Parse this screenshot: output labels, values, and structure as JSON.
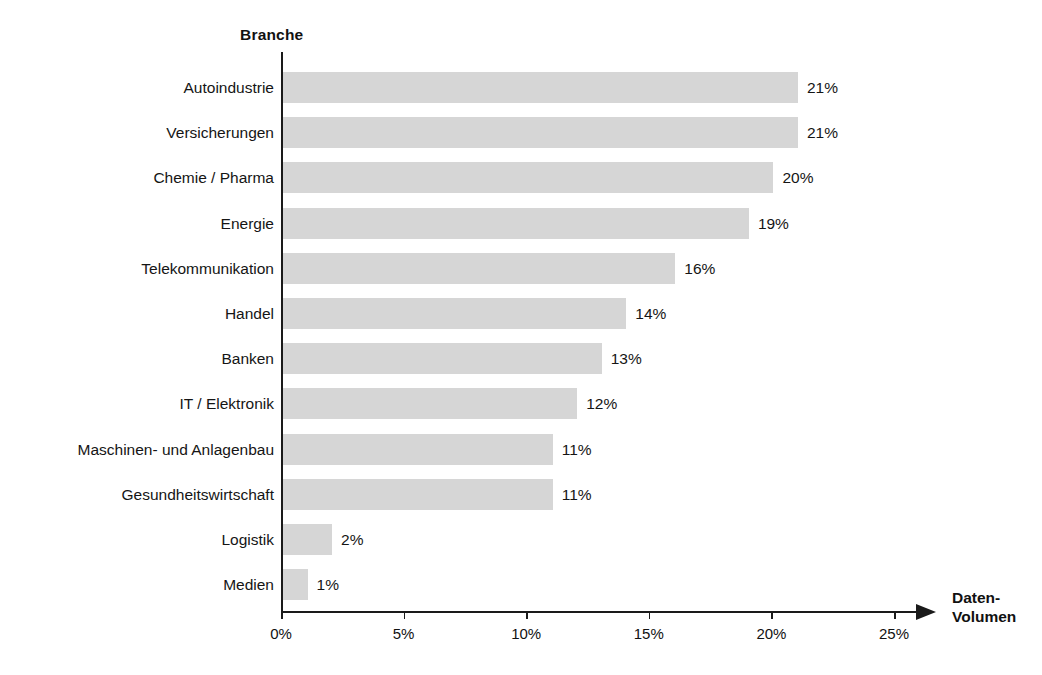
{
  "chart_data": {
    "type": "bar",
    "orientation": "horizontal",
    "title": "",
    "ylabel": "Branche",
    "xlabel": "Daten-Volumen",
    "xlabel_lines": [
      "Daten-",
      "Volumen"
    ],
    "categories": [
      "Autoindustrie",
      "Versicherungen",
      "Chemie / Pharma",
      "Energie",
      "Telekommunikation",
      "Handel",
      "Banken",
      "IT / Elektronik",
      "Maschinen- und Anlagenbau",
      "Gesundheitswirtschaft",
      "Logistik",
      "Medien"
    ],
    "values": [
      21,
      21,
      20,
      19,
      16,
      14,
      13,
      12,
      11,
      11,
      2,
      1
    ],
    "value_labels": [
      "21%",
      "21%",
      "20%",
      "19%",
      "16%",
      "14%",
      "13%",
      "12%",
      "11%",
      "11%",
      "2%",
      "1%"
    ],
    "xlim": [
      0,
      26.2
    ],
    "xticks": [
      0,
      5,
      10,
      15,
      20,
      25
    ],
    "xtick_labels": [
      "0%",
      "5%",
      "10%",
      "15%",
      "20%",
      "25%"
    ],
    "grid": false,
    "legend": false,
    "bar_color": "#d6d6d6",
    "axis_color": "#1a1a1a",
    "text_color": "#151515",
    "background_color": "#ffffff"
  }
}
